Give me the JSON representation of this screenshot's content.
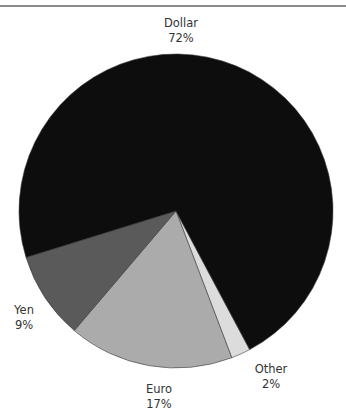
{
  "chart_data": {
    "type": "pie",
    "title": "",
    "categories": [
      "Dollar",
      "Other",
      "Euro",
      "Yen"
    ],
    "values": [
      72,
      2,
      17,
      9
    ],
    "unit": "%",
    "colors": {
      "Dollar": "#0d0d0d",
      "Other": "#dcdcdc",
      "Euro": "#ababab",
      "Yen": "#5a5a5a"
    },
    "labels": [
      {
        "name": "Dollar",
        "percent": "72%"
      },
      {
        "name": "Other",
        "percent": "2%"
      },
      {
        "name": "Euro",
        "percent": "17%"
      },
      {
        "name": "Yen",
        "percent": "9%"
      }
    ],
    "legend": "none (labels placed next to slices)",
    "start_angle_deg": 62,
    "direction": "clockwise from Other"
  }
}
